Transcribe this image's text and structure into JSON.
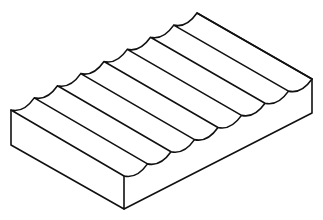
{
  "figure": {
    "stroke_color": "#111111",
    "background": "#ffffff",
    "groove_count": 8
  }
}
